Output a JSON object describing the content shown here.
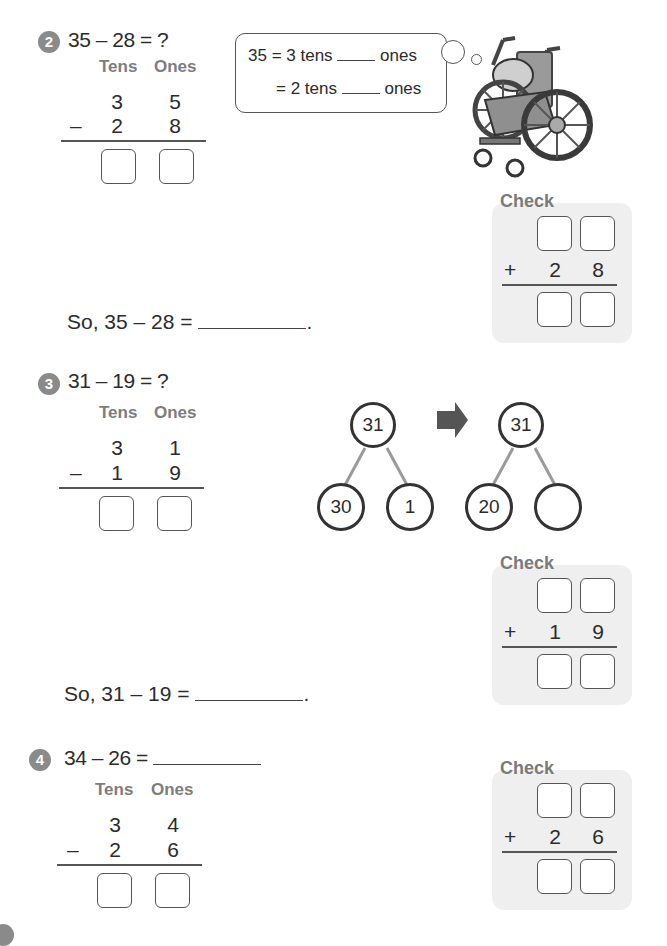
{
  "problems": [
    {
      "number": "2",
      "equation": "35 – 28 = ?",
      "column_headers": {
        "tens": "Tens",
        "ones": "Ones"
      },
      "top": {
        "tens": "3",
        "ones": "5"
      },
      "bottom": {
        "operator": "–",
        "tens": "2",
        "ones": "8"
      },
      "hint_bubble": {
        "line1": {
          "prefix": "35 = 3 tens",
          "suffix": "ones"
        },
        "line2": {
          "prefix": "= 2 tens",
          "suffix": "ones"
        }
      },
      "illustration": "hedgehog-in-wheelchair",
      "so_line": {
        "prefix": "So, 35 – 28 =",
        "suffix": "."
      },
      "check": {
        "title": "Check",
        "operator": "+",
        "tens": "2",
        "ones": "8"
      }
    },
    {
      "number": "3",
      "equation": "31 – 19 = ?",
      "column_headers": {
        "tens": "Tens",
        "ones": "Ones"
      },
      "top": {
        "tens": "3",
        "ones": "1"
      },
      "bottom": {
        "operator": "–",
        "tens": "1",
        "ones": "9"
      },
      "number_bonds": [
        {
          "whole": "31",
          "parts": [
            "30",
            "1"
          ]
        },
        {
          "whole": "31",
          "parts": [
            "20",
            ""
          ]
        }
      ],
      "so_line": {
        "prefix": "So, 31 – 19 =",
        "suffix": "."
      },
      "check": {
        "title": "Check",
        "operator": "+",
        "tens": "1",
        "ones": "9"
      }
    },
    {
      "number": "4",
      "equation": "34 – 26 =",
      "column_headers": {
        "tens": "Tens",
        "ones": "Ones"
      },
      "top": {
        "tens": "3",
        "ones": "4"
      },
      "bottom": {
        "operator": "–",
        "tens": "2",
        "ones": "6"
      },
      "check": {
        "title": "Check",
        "operator": "+",
        "tens": "2",
        "ones": "6"
      }
    }
  ],
  "colors": {
    "badge": "#8a8a8a",
    "header_text": "#7d7d7d",
    "check_bg": "#efefef",
    "bond_line": "#9a9a9a",
    "arrow": "#555555"
  }
}
